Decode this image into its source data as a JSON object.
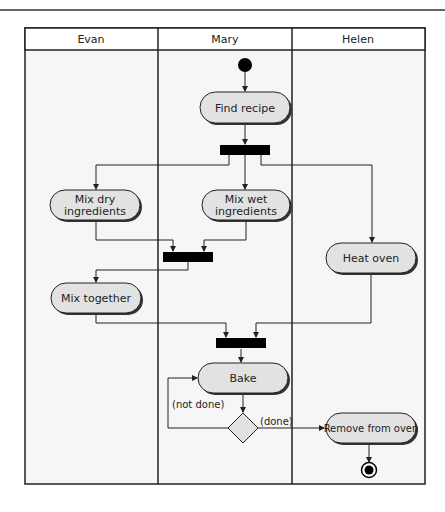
{
  "diagram": {
    "type": "UML activity diagram with swimlanes",
    "lanes": [
      {
        "label": "Evan"
      },
      {
        "label": "Mary"
      },
      {
        "label": "Helen"
      }
    ],
    "nodes": {
      "start": {
        "kind": "initial"
      },
      "find_recipe": {
        "label": "Find recipe",
        "lane": "Mary"
      },
      "fork1": {
        "kind": "fork"
      },
      "mix_dry": {
        "line1": "Mix dry",
        "line2": "ingredients",
        "lane": "Evan"
      },
      "mix_wet": {
        "line1": "Mix wet",
        "line2": "ingredients",
        "lane": "Mary"
      },
      "heat_oven": {
        "label": "Heat oven",
        "lane": "Helen"
      },
      "join1": {
        "kind": "join"
      },
      "mix_together": {
        "label": "Mix together",
        "lane": "Evan"
      },
      "join2": {
        "kind": "join"
      },
      "bake": {
        "label": "Bake",
        "lane": "Mary"
      },
      "decision": {
        "kind": "decision"
      },
      "remove": {
        "label": "Remove from oven",
        "lane": "Helen"
      },
      "end": {
        "kind": "final"
      }
    },
    "guards": {
      "not_done": "(not done)",
      "done": "(done)"
    },
    "colors": {
      "node_fill": "#e2e2e2",
      "node_shadow": "#333333",
      "bar": "#000000",
      "line": "#222222",
      "lane_bg": "#f4f4f4"
    }
  }
}
